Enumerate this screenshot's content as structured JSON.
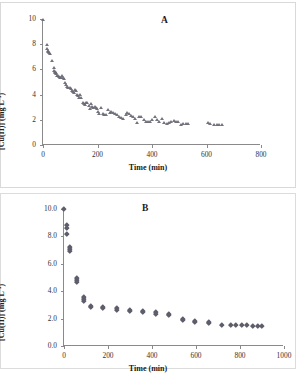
{
  "figure": {
    "panels": [
      {
        "id": "A",
        "letter": "A"
      },
      {
        "id": "B",
        "letter": "B"
      }
    ]
  },
  "chart_data": [
    {
      "type": "scatter",
      "panel_label": "A",
      "title": "",
      "xlabel": "Time (min)",
      "ylabel": "[Cu(II)] (mg L-1)",
      "ylabel_html": "[Cu(II)] (mg L<sup>-1</sup>)",
      "xlim": [
        0,
        800
      ],
      "ylim": [
        0,
        10
      ],
      "xticks": [
        0,
        200,
        400,
        600,
        800
      ],
      "xticklabels": [
        "0",
        "200",
        "400",
        "600",
        "800"
      ],
      "yticks": [
        0,
        2,
        4,
        6,
        8,
        10
      ],
      "yticklabels": [
        "0",
        "2",
        "4",
        "6",
        "8",
        "10"
      ],
      "grid": false,
      "legend": false,
      "marker": "triangle",
      "marker_color": "#6b6b78",
      "series": [
        {
          "name": "Cu(II) concentration",
          "points": [
            [
              2,
              9.9
            ],
            [
              14,
              7.9
            ],
            [
              16,
              7.6
            ],
            [
              18,
              7.5
            ],
            [
              20,
              7.4
            ],
            [
              22,
              7.3
            ],
            [
              25,
              7.2
            ],
            [
              34,
              6.7
            ],
            [
              40,
              6.1
            ],
            [
              42,
              5.9
            ],
            [
              44,
              5.8
            ],
            [
              46,
              5.75
            ],
            [
              48,
              5.7
            ],
            [
              50,
              5.6
            ],
            [
              52,
              5.5
            ],
            [
              55,
              5.45
            ],
            [
              58,
              5.4
            ],
            [
              62,
              5.35
            ],
            [
              66,
              5.3
            ],
            [
              70,
              5.5
            ],
            [
              74,
              5.3
            ],
            [
              78,
              5.25
            ],
            [
              82,
              4.9
            ],
            [
              86,
              4.75
            ],
            [
              90,
              4.6
            ],
            [
              94,
              4.55
            ],
            [
              98,
              4.5
            ],
            [
              102,
              4.45
            ],
            [
              106,
              4.3
            ],
            [
              110,
              4.2
            ],
            [
              114,
              4.15
            ],
            [
              118,
              4.4
            ],
            [
              122,
              4.25
            ],
            [
              126,
              4.0
            ],
            [
              130,
              3.85
            ],
            [
              134,
              3.75
            ],
            [
              138,
              4.0
            ],
            [
              142,
              3.7
            ],
            [
              146,
              3.3
            ],
            [
              150,
              3.25
            ],
            [
              156,
              3.2
            ],
            [
              160,
              3.35
            ],
            [
              164,
              3.3
            ],
            [
              168,
              3.1
            ],
            [
              172,
              2.85
            ],
            [
              176,
              3.25
            ],
            [
              182,
              3.0
            ],
            [
              186,
              2.95
            ],
            [
              190,
              3.0
            ],
            [
              194,
              2.9
            ],
            [
              198,
              2.85
            ],
            [
              202,
              2.6
            ],
            [
              208,
              2.45
            ],
            [
              214,
              2.9
            ],
            [
              220,
              2.5
            ],
            [
              226,
              2.35
            ],
            [
              232,
              2.4
            ],
            [
              240,
              2.75
            ],
            [
              246,
              2.55
            ],
            [
              252,
              2.6
            ],
            [
              258,
              2.55
            ],
            [
              264,
              2.5
            ],
            [
              272,
              2.4
            ],
            [
              280,
              2.2
            ],
            [
              288,
              2.15
            ],
            [
              296,
              2.1
            ],
            [
              304,
              2.4
            ],
            [
              310,
              2.55
            ],
            [
              316,
              2.45
            ],
            [
              322,
              2.3
            ],
            [
              330,
              2.2
            ],
            [
              338,
              2.1
            ],
            [
              346,
              1.75
            ],
            [
              354,
              2.2
            ],
            [
              362,
              2.25
            ],
            [
              370,
              2.0
            ],
            [
              378,
              1.85
            ],
            [
              386,
              1.8
            ],
            [
              394,
              1.85
            ],
            [
              402,
              2.0
            ],
            [
              410,
              2.25
            ],
            [
              418,
              2.0
            ],
            [
              426,
              1.85
            ],
            [
              436,
              2.1
            ],
            [
              446,
              1.75
            ],
            [
              456,
              1.7
            ],
            [
              464,
              1.75
            ],
            [
              472,
              1.85
            ],
            [
              480,
              1.9
            ],
            [
              488,
              1.85
            ],
            [
              496,
              1.8
            ],
            [
              506,
              1.6
            ],
            [
              514,
              1.7
            ],
            [
              524,
              1.65
            ],
            [
              534,
              1.7
            ],
            [
              606,
              1.75
            ],
            [
              614,
              1.65
            ],
            [
              628,
              1.6
            ],
            [
              638,
              1.6
            ],
            [
              648,
              1.6
            ],
            [
              658,
              1.6
            ]
          ]
        }
      ]
    },
    {
      "type": "scatter",
      "panel_label": "B",
      "title": "",
      "xlabel": "Time (min)",
      "ylabel": "[Cu(II)] (mg L-1)",
      "ylabel_html": "[Cu(II)] (mg L<sup>-1</sup>)",
      "xlim": [
        0,
        1000
      ],
      "ylim": [
        0,
        10
      ],
      "xticks": [
        0,
        200,
        400,
        600,
        800,
        1000
      ],
      "xticklabels": [
        "0",
        "200",
        "400",
        "600",
        "800",
        "1000"
      ],
      "yticks": [
        0,
        2,
        4,
        6,
        8,
        10
      ],
      "yticklabels": [
        "0.0",
        "2.0",
        "4.0",
        "6.0",
        "8.0",
        "10.0"
      ],
      "grid": false,
      "legend": false,
      "marker": "diamond",
      "marker_color": "#5d5d6b",
      "series": [
        {
          "name": "Cu(II) concentration",
          "points": [
            [
              2,
              10.0
            ],
            [
              14,
              8.8
            ],
            [
              14,
              8.6
            ],
            [
              16,
              8.2
            ],
            [
              30,
              7.2
            ],
            [
              30,
              7.05
            ],
            [
              30,
              6.95
            ],
            [
              62,
              5.0
            ],
            [
              62,
              4.8
            ],
            [
              62,
              4.65
            ],
            [
              92,
              3.55
            ],
            [
              92,
              3.4
            ],
            [
              92,
              3.3
            ],
            [
              122,
              2.9
            ],
            [
              122,
              2.85
            ],
            [
              178,
              2.85
            ],
            [
              178,
              2.75
            ],
            [
              240,
              2.75
            ],
            [
              240,
              2.65
            ],
            [
              302,
              2.65
            ],
            [
              302,
              2.55
            ],
            [
              360,
              2.55
            ],
            [
              360,
              2.45
            ],
            [
              420,
              2.45
            ],
            [
              420,
              2.35
            ],
            [
              478,
              2.35
            ],
            [
              478,
              2.25
            ],
            [
              540,
              1.95
            ],
            [
              540,
              1.9
            ],
            [
              598,
              1.85
            ],
            [
              598,
              1.75
            ],
            [
              658,
              1.75
            ],
            [
              658,
              1.65
            ],
            [
              718,
              1.55
            ],
            [
              758,
              1.5
            ],
            [
              782,
              1.5
            ],
            [
              808,
              1.5
            ],
            [
              832,
              1.5
            ],
            [
              858,
              1.45
            ],
            [
              882,
              1.45
            ],
            [
              902,
              1.45
            ]
          ]
        }
      ]
    }
  ]
}
